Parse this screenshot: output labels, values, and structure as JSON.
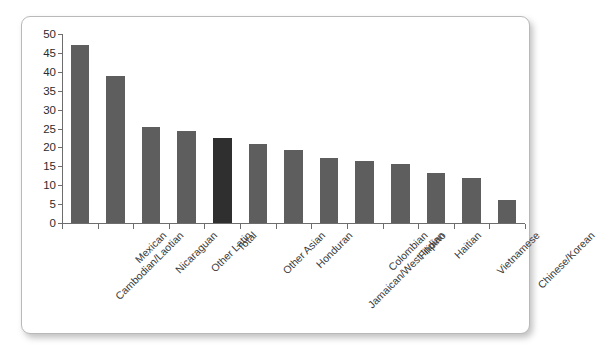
{
  "chart_data": {
    "type": "bar",
    "title": "",
    "subtitle": "",
    "xlabel": "",
    "ylabel": "",
    "ylim": [
      0,
      50
    ],
    "yticks": [
      0,
      5,
      10,
      15,
      20,
      25,
      30,
      35,
      40,
      45,
      50
    ],
    "grid": false,
    "legend": null,
    "categories": [
      "Cambodian/Laotian",
      "Mexican",
      "Nicaraguan",
      "Other Latin",
      "Total",
      "Other Asian",
      "Honduran",
      "Jamaican/West Indian",
      "Colombian",
      "Filipino",
      "Haitian",
      "Vietnamese",
      "Chinese/Korean"
    ],
    "values": [
      47,
      39,
      25.5,
      24.3,
      22.5,
      21,
      19.3,
      17.3,
      16.3,
      15.5,
      13.2,
      12,
      6
    ],
    "highlight_category": "Total",
    "highlight_index": 4,
    "bar_color": "#5e5e5e",
    "highlight_color": "#2f2f2f",
    "axis_color": "#6d6d6d",
    "background_color": "#ffffff"
  }
}
